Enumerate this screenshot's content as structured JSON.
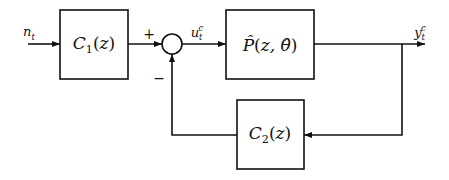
{
  "diagram": {
    "type": "block-diagram",
    "colors": {
      "stroke": "#111111",
      "background": "#ffffff"
    },
    "blocks": [
      {
        "id": "c1",
        "label": "C₁(z)",
        "label_base": "C",
        "label_sub": "1",
        "label_args": "(z)"
      },
      {
        "id": "plant",
        "label": "P̂(z, θ̂)",
        "label_base": "P̂",
        "label_args": "(z, θ̂)"
      },
      {
        "id": "c2",
        "label": "C₂(z)",
        "label_base": "C",
        "label_sub": "2",
        "label_args": "(z)"
      }
    ],
    "summing_junction": {
      "plus_sign": "+",
      "minus_sign": "−"
    },
    "signals": {
      "input": {
        "base": "n",
        "sub": "t"
      },
      "control": {
        "base": "u",
        "sub": "t",
        "sup": "c"
      },
      "output": {
        "base": "y",
        "sub": "t",
        "sup": "c"
      }
    },
    "connections": [
      "n_t → C1(z)",
      "C1(z) → summing junction (+)",
      "summing junction → u_t^c → P̂(z,θ̂)",
      "P̂(z,θ̂) → y_t^c",
      "y_t^c → C2(z) (feedback)",
      "C2(z) → summing junction (−)"
    ]
  }
}
